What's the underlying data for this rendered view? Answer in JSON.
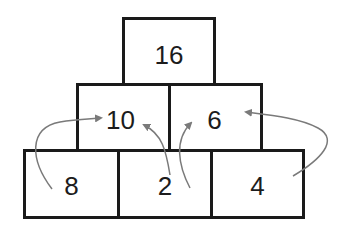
{
  "pyramid": {
    "top": [
      {
        "value": "16"
      }
    ],
    "middle": [
      {
        "value": "10"
      },
      {
        "value": "6"
      }
    ],
    "bottom": [
      {
        "value": "8"
      },
      {
        "value": "2"
      },
      {
        "value": "4"
      }
    ]
  },
  "arrows": [
    {
      "from": "8",
      "to": "10"
    },
    {
      "from": "2",
      "to": "10"
    },
    {
      "from": "2",
      "to": "6"
    },
    {
      "from": "4",
      "to": "6"
    }
  ],
  "colors": {
    "border": "#1a1a1a",
    "arrow": "#7a7a7a",
    "text": "#1c1c1c"
  }
}
